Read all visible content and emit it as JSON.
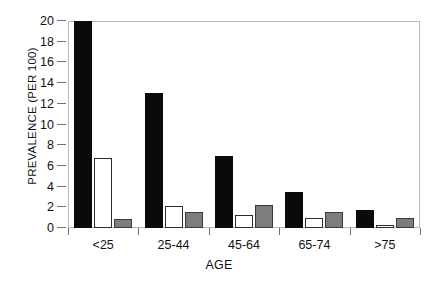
{
  "chart_data": {
    "type": "bar",
    "title": "",
    "xlabel": "AGE",
    "ylabel": "PREVALENCE (PER 100)",
    "ylim": [
      0,
      20
    ],
    "ytick_labels": [
      "0",
      "2",
      "4",
      "6",
      "8",
      "10",
      "12",
      "14",
      "16",
      "18",
      "20"
    ],
    "ytick_values": [
      0,
      2,
      4,
      6,
      8,
      10,
      12,
      14,
      16,
      18,
      20
    ],
    "grid": false,
    "legend_position": "none",
    "categories": [
      "<25",
      "25-44",
      "45-64",
      "65-74",
      ">75"
    ],
    "series": [
      {
        "name": "series-1-black",
        "color": "#0a0a0a",
        "values": [
          20.0,
          13.0,
          7.0,
          3.5,
          1.7
        ]
      },
      {
        "name": "series-2-white",
        "color": "#ffffff",
        "values": [
          6.8,
          2.1,
          1.3,
          1.0,
          0.3
        ]
      },
      {
        "name": "series-3-gray",
        "color": "#7d7d7d",
        "values": [
          0.9,
          1.5,
          2.2,
          1.5,
          1.0
        ]
      }
    ]
  },
  "axes": {
    "y_title": "PREVALENCE (PER 100)",
    "x_title": "AGE"
  }
}
